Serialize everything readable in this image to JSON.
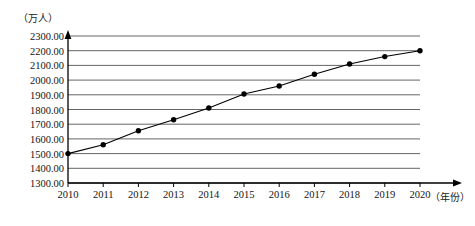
{
  "chart_data": {
    "type": "line",
    "title": "",
    "subtitle": "",
    "xlabel": "（年份）",
    "ylabel": "（万人）",
    "categories": [
      "2010",
      "2011",
      "2012",
      "2013",
      "2014",
      "2015",
      "2016",
      "2017",
      "2018",
      "2019",
      "2020"
    ],
    "x": [
      2010,
      2011,
      2012,
      2013,
      2014,
      2015,
      2016,
      2017,
      2018,
      2019,
      2020
    ],
    "values": [
      1500,
      1560,
      1655,
      1730,
      1810,
      1905,
      1960,
      2040,
      2110,
      2160,
      2200
    ],
    "series": [
      {
        "name": "人口",
        "values": [
          1500,
          1560,
          1655,
          1730,
          1810,
          1905,
          1960,
          2040,
          2110,
          2160,
          2200
        ]
      }
    ],
    "ylim": [
      1300,
      2300
    ],
    "xlim": [
      2010,
      2020
    ],
    "ytick_labels": [
      "1300.00",
      "1400.00",
      "1500.00",
      "1600.00",
      "1700.00",
      "1800.00",
      "1900.00",
      "2000.00",
      "2100.00",
      "2200.00",
      "2300.00"
    ],
    "ytick_values": [
      1300,
      1400,
      1500,
      1600,
      1700,
      1800,
      1900,
      2000,
      2100,
      2200,
      2300
    ],
    "ytick_step": 100,
    "grid": "horizontal",
    "legend": "none",
    "marker": "filled-circle",
    "line_color": "#000000",
    "marker_color": "#000000",
    "grid_color": "#555555",
    "axis_color": "#000000",
    "background": "#ffffff"
  }
}
